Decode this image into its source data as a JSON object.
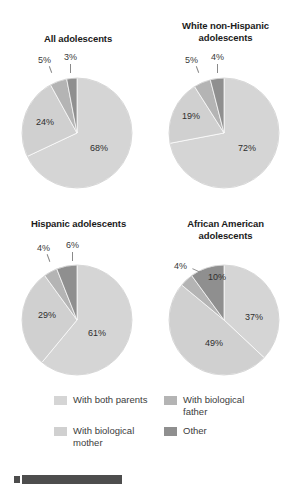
{
  "figure": {
    "background": "#ffffff"
  },
  "colors": {
    "with_both_parents": "#d5d5d5",
    "with_biological_mother": "#d0d0d0",
    "with_biological_father": "#b4b4b4",
    "other": "#8f8f8f",
    "slice_outline": "#ffffff",
    "label_text": "#3a3a3a",
    "title_text": "#1b1b1b",
    "bottom_bar": "#4d4d4d"
  },
  "legend": {
    "items": [
      {
        "label": "With both parents",
        "color": "#d5d5d5",
        "swatch": "legend-swatch-both-parents"
      },
      {
        "label": "With biological mother",
        "color": "#d0d0d0",
        "swatch": "legend-swatch-mother"
      },
      {
        "label": "With biological father",
        "color": "#b4b4b4",
        "swatch": "legend-swatch-father"
      },
      {
        "label": "Other",
        "color": "#8f8f8f",
        "swatch": "legend-swatch-other"
      }
    ]
  },
  "chart_data": [
    {
      "type": "pie",
      "title": "All adolescents",
      "categories": [
        "With both parents",
        "With biological mother",
        "With biological father",
        "Other"
      ],
      "values": [
        68,
        24,
        5,
        3
      ],
      "labels": [
        "68%",
        "24%",
        "5%",
        "3%"
      ],
      "colors": [
        "#d5d5d5",
        "#d0d0d0",
        "#b4b4b4",
        "#8f8f8f"
      ],
      "start_angle_deg": 0,
      "direction": "clockwise",
      "legend_position": "bottom"
    },
    {
      "type": "pie",
      "title": "White non-Hispanic adolescents",
      "categories": [
        "With both parents",
        "With biological mother",
        "With biological father",
        "Other"
      ],
      "values": [
        72,
        19,
        5,
        4
      ],
      "labels": [
        "72%",
        "19%",
        "5%",
        "4%"
      ],
      "colors": [
        "#d5d5d5",
        "#d0d0d0",
        "#b4b4b4",
        "#8f8f8f"
      ],
      "start_angle_deg": 0,
      "direction": "clockwise",
      "legend_position": "bottom"
    },
    {
      "type": "pie",
      "title": "Hispanic adolescents",
      "categories": [
        "With both parents",
        "With biological mother",
        "With biological father",
        "Other"
      ],
      "values": [
        61,
        29,
        4,
        6
      ],
      "labels": [
        "61%",
        "29%",
        "4%",
        "6%"
      ],
      "colors": [
        "#d5d5d5",
        "#d0d0d0",
        "#b4b4b4",
        "#8f8f8f"
      ],
      "start_angle_deg": 0,
      "direction": "clockwise",
      "legend_position": "bottom"
    },
    {
      "type": "pie",
      "title": "African American adolescents",
      "categories": [
        "With both parents",
        "With biological mother",
        "With biological father",
        "Other"
      ],
      "values": [
        37,
        49,
        4,
        10
      ],
      "labels": [
        "37%",
        "49%",
        "4%",
        "10%"
      ],
      "colors": [
        "#d5d5d5",
        "#d0d0d0",
        "#b4b4b4",
        "#8f8f8f"
      ],
      "start_angle_deg": 0,
      "direction": "clockwise",
      "legend_position": "bottom"
    }
  ],
  "panels": {
    "all": {
      "title": "All adolescents",
      "labels": {
        "both": "68%",
        "mother": "24%",
        "father": "5%",
        "other": "3%"
      }
    },
    "white": {
      "title_line1": "White non-Hispanic",
      "title_line2": "adolescents",
      "labels": {
        "both": "72%",
        "mother": "19%",
        "father": "5%",
        "other": "4%"
      }
    },
    "hispanic": {
      "title": "Hispanic adolescents",
      "labels": {
        "both": "61%",
        "mother": "29%",
        "father": "4%",
        "other": "6%"
      }
    },
    "african": {
      "title_line1": "African American",
      "title_line2": "adolescents",
      "labels": {
        "both": "37%",
        "mother": "49%",
        "father": "4%",
        "other": "10%"
      }
    }
  }
}
